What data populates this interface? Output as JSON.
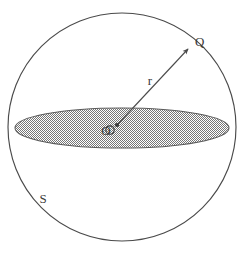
{
  "figure": {
    "background_color": "#ffffff",
    "stroke_color": "#4a4a4a",
    "hatch_color": "#8c8c8c",
    "labels": {
      "point_q": "Q",
      "radius": "r",
      "surface": "S",
      "center": "O"
    },
    "geometry": {
      "sphere_outline": {
        "shape": "circle",
        "center_x": 122,
        "center_y": 127,
        "radius": 114,
        "fill": "none"
      },
      "equatorial_disc": {
        "shape": "ellipse",
        "center_x": 122,
        "center_y": 128,
        "semi_major_axis": 107,
        "semi_minor_axis": 20,
        "fill": "hatched-gray"
      },
      "center_marker": {
        "shape": "small-circle",
        "center_x": 110,
        "center_y": 130,
        "radius": 4
      },
      "center_point_dot": {
        "center_x": 117,
        "center_y": 125,
        "radius": 2
      },
      "radius_vector": {
        "from_x": 117,
        "from_y": 125,
        "to_x": 189,
        "to_y": 48,
        "arrow_head": true
      }
    },
    "label_positions": {
      "point_q": {
        "x": 195,
        "y": 46
      },
      "radius": {
        "x": 150,
        "y": 85
      },
      "surface": {
        "x": 43,
        "y": 203
      },
      "center": {
        "x": 106,
        "y": 135
      }
    }
  }
}
